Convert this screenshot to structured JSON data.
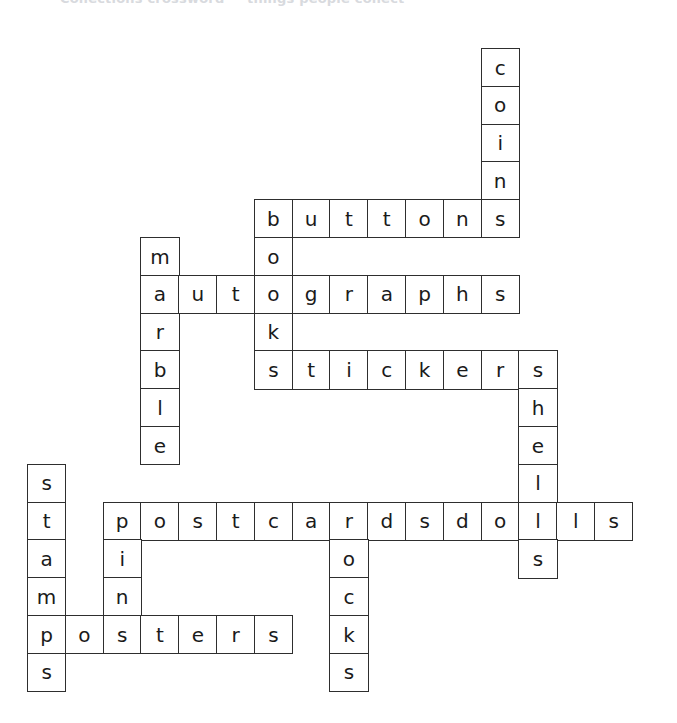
{
  "header": {
    "clipped_text": "Collections crossword — things people collect"
  },
  "puzzle": {
    "title": "collections crossword grid",
    "cell_size": 37.8,
    "origin_x": 27,
    "origin_y": 48,
    "border_color": "#2e2e2e",
    "cell_fill": "#ffffff",
    "letter_color": "#1a1a1a",
    "entries": [
      {
        "word": "coins",
        "direction": "down",
        "row": 0,
        "col": 12
      },
      {
        "word": "buttons",
        "direction": "across",
        "row": 4,
        "col": 6
      },
      {
        "word": "marble",
        "direction": "down",
        "row": 5,
        "col": 3
      },
      {
        "word": "books",
        "direction": "down",
        "row": 4,
        "col": 6
      },
      {
        "word": "autographs",
        "direction": "across",
        "row": 6,
        "col": 3
      },
      {
        "word": "stickers",
        "direction": "across",
        "row": 8,
        "col": 6
      },
      {
        "word": "shells",
        "direction": "down",
        "row": 8,
        "col": 13
      },
      {
        "word": "dolls",
        "direction": "across",
        "row": 12,
        "col": 11
      },
      {
        "word": "stamps",
        "direction": "down",
        "row": 11,
        "col": 0
      },
      {
        "word": "pins",
        "direction": "down",
        "row": 12,
        "col": 2
      },
      {
        "word": "postcards",
        "direction": "across",
        "row": 12,
        "col": 2
      },
      {
        "word": "rocks",
        "direction": "down",
        "row": 12,
        "col": 8
      },
      {
        "word": "posters",
        "direction": "across",
        "row": 15,
        "col": 0
      }
    ],
    "letters": [
      {
        "row": 0,
        "col": 12,
        "letter": "c"
      },
      {
        "row": 1,
        "col": 12,
        "letter": "o"
      },
      {
        "row": 2,
        "col": 12,
        "letter": "i"
      },
      {
        "row": 3,
        "col": 12,
        "letter": "n"
      },
      {
        "row": 4,
        "col": 6,
        "letter": "b"
      },
      {
        "row": 4,
        "col": 7,
        "letter": "u"
      },
      {
        "row": 4,
        "col": 8,
        "letter": "t"
      },
      {
        "row": 4,
        "col": 9,
        "letter": "t"
      },
      {
        "row": 4,
        "col": 10,
        "letter": "o"
      },
      {
        "row": 4,
        "col": 11,
        "letter": "n"
      },
      {
        "row": 4,
        "col": 12,
        "letter": "s"
      },
      {
        "row": 5,
        "col": 3,
        "letter": "m"
      },
      {
        "row": 5,
        "col": 6,
        "letter": "o"
      },
      {
        "row": 6,
        "col": 3,
        "letter": "a"
      },
      {
        "row": 6,
        "col": 4,
        "letter": "u"
      },
      {
        "row": 6,
        "col": 5,
        "letter": "t"
      },
      {
        "row": 6,
        "col": 6,
        "letter": "o"
      },
      {
        "row": 6,
        "col": 7,
        "letter": "g"
      },
      {
        "row": 6,
        "col": 8,
        "letter": "r"
      },
      {
        "row": 6,
        "col": 9,
        "letter": "a"
      },
      {
        "row": 6,
        "col": 10,
        "letter": "p"
      },
      {
        "row": 6,
        "col": 11,
        "letter": "h"
      },
      {
        "row": 6,
        "col": 12,
        "letter": "s"
      },
      {
        "row": 7,
        "col": 3,
        "letter": "r"
      },
      {
        "row": 7,
        "col": 6,
        "letter": "k"
      },
      {
        "row": 8,
        "col": 3,
        "letter": "b"
      },
      {
        "row": 8,
        "col": 6,
        "letter": "s"
      },
      {
        "row": 8,
        "col": 7,
        "letter": "t"
      },
      {
        "row": 8,
        "col": 8,
        "letter": "i"
      },
      {
        "row": 8,
        "col": 9,
        "letter": "c"
      },
      {
        "row": 8,
        "col": 10,
        "letter": "k"
      },
      {
        "row": 8,
        "col": 11,
        "letter": "e"
      },
      {
        "row": 8,
        "col": 12,
        "letter": "r"
      },
      {
        "row": 8,
        "col": 13,
        "letter": "s"
      },
      {
        "row": 9,
        "col": 3,
        "letter": "l"
      },
      {
        "row": 9,
        "col": 13,
        "letter": "h"
      },
      {
        "row": 10,
        "col": 3,
        "letter": "e"
      },
      {
        "row": 10,
        "col": 13,
        "letter": "e"
      },
      {
        "row": 11,
        "col": 0,
        "letter": "s"
      },
      {
        "row": 11,
        "col": 13,
        "letter": "l"
      },
      {
        "row": 12,
        "col": 0,
        "letter": "t"
      },
      {
        "row": 12,
        "col": 2,
        "letter": "p"
      },
      {
        "row": 12,
        "col": 3,
        "letter": "o"
      },
      {
        "row": 12,
        "col": 4,
        "letter": "s"
      },
      {
        "row": 12,
        "col": 5,
        "letter": "t"
      },
      {
        "row": 12,
        "col": 6,
        "letter": "c"
      },
      {
        "row": 12,
        "col": 7,
        "letter": "a"
      },
      {
        "row": 12,
        "col": 8,
        "letter": "r"
      },
      {
        "row": 12,
        "col": 9,
        "letter": "d"
      },
      {
        "row": 12,
        "col": 10,
        "letter": "s"
      },
      {
        "row": 12,
        "col": 11,
        "letter": "d"
      },
      {
        "row": 12,
        "col": 12,
        "letter": "o"
      },
      {
        "row": 12,
        "col": 13,
        "letter": "l"
      },
      {
        "row": 12,
        "col": 14,
        "letter": "l"
      },
      {
        "row": 12,
        "col": 15,
        "letter": "s"
      },
      {
        "row": 13,
        "col": 0,
        "letter": "a"
      },
      {
        "row": 13,
        "col": 2,
        "letter": "i"
      },
      {
        "row": 13,
        "col": 8,
        "letter": "o"
      },
      {
        "row": 13,
        "col": 13,
        "letter": "s"
      },
      {
        "row": 14,
        "col": 0,
        "letter": "m"
      },
      {
        "row": 14,
        "col": 2,
        "letter": "n"
      },
      {
        "row": 14,
        "col": 8,
        "letter": "c"
      },
      {
        "row": 15,
        "col": 0,
        "letter": "p"
      },
      {
        "row": 15,
        "col": 1,
        "letter": "o"
      },
      {
        "row": 15,
        "col": 2,
        "letter": "s"
      },
      {
        "row": 15,
        "col": 3,
        "letter": "t"
      },
      {
        "row": 15,
        "col": 4,
        "letter": "e"
      },
      {
        "row": 15,
        "col": 5,
        "letter": "r"
      },
      {
        "row": 15,
        "col": 6,
        "letter": "s"
      },
      {
        "row": 15,
        "col": 8,
        "letter": "k"
      },
      {
        "row": 16,
        "col": 0,
        "letter": "s"
      },
      {
        "row": 16,
        "col": 8,
        "letter": "s"
      }
    ]
  }
}
